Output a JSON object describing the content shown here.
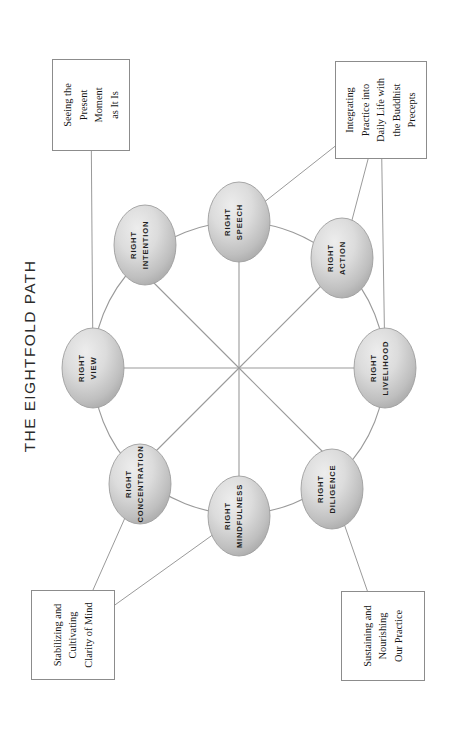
{
  "page": {
    "title": "THE EIGHTFOLD PATH",
    "background_color": "#ffffff",
    "width": 460,
    "height": 743
  },
  "diagram": {
    "type": "wheel",
    "hub": {
      "x": 239,
      "y": 368
    },
    "wheel_radius": 146,
    "node_rx": 31,
    "node_ry": 40,
    "stroke_color": "#9a9a9a",
    "node_fill_light": "#e4e4e4",
    "node_fill_dark": "#a9a9a9",
    "node_stroke": "#9e9e9e",
    "nodes": [
      {
        "id": "right-view",
        "line1": "RIGHT",
        "line2": "VIEW",
        "x": 93,
        "y": 368,
        "angle_deg": 180
      },
      {
        "id": "right-intention",
        "line1": "RIGHT",
        "line2": "INTENTION",
        "x": 145,
        "y": 245,
        "angle_deg": 225
      },
      {
        "id": "right-speech",
        "line1": "RIGHT",
        "line2": "SPEECH",
        "x": 239,
        "y": 222,
        "angle_deg": 270
      },
      {
        "id": "right-action",
        "line1": "RIGHT",
        "line2": "ACTION",
        "x": 342,
        "y": 258,
        "angle_deg": 315
      },
      {
        "id": "right-livelihood",
        "line1": "RIGHT",
        "line2": "LIVELIHOOD",
        "x": 385,
        "y": 368,
        "angle_deg": 0
      },
      {
        "id": "right-diligence",
        "line1": "RIGHT",
        "line2": "DILIGENCE",
        "x": 332,
        "y": 489,
        "angle_deg": 45
      },
      {
        "id": "right-mindfulness",
        "line1": "RIGHT",
        "line2": "MINDFULNESS",
        "x": 239,
        "y": 516,
        "angle_deg": 90
      },
      {
        "id": "right-concentration",
        "line1": "RIGHT",
        "line2": "CONCENTRATION",
        "x": 140,
        "y": 484,
        "angle_deg": 135
      }
    ],
    "captions": [
      {
        "id": "caption-seeing-present-moment",
        "lines": [
          "Seeing the",
          "Present",
          "Moment",
          "as It Is"
        ],
        "x": 91,
        "y": 105,
        "w": 92,
        "h": 78,
        "connects_to": [
          "right-view"
        ]
      },
      {
        "id": "caption-integrating-practice",
        "lines": [
          "Integrating",
          "Practice into",
          "Daily Life with",
          "the Buddhist",
          "Precepts"
        ],
        "x": 381,
        "y": 110,
        "w": 98,
        "h": 92,
        "connects_to": [
          "right-speech",
          "right-action",
          "right-livelihood"
        ]
      },
      {
        "id": "caption-stabilizing-clarity",
        "lines": [
          "Stabilizing and",
          "Cultivating",
          "Clarity of Mind"
        ],
        "x": 73,
        "y": 635,
        "w": 90,
        "h": 84,
        "connects_to": [
          "right-concentration",
          "right-mindfulness"
        ]
      },
      {
        "id": "caption-sustaining-nourishing",
        "lines": [
          "Sustaining and",
          "Nourishing",
          "Our Practice"
        ],
        "x": 383,
        "y": 636,
        "w": 90,
        "h": 84,
        "connects_to": [
          "right-diligence"
        ]
      }
    ]
  }
}
